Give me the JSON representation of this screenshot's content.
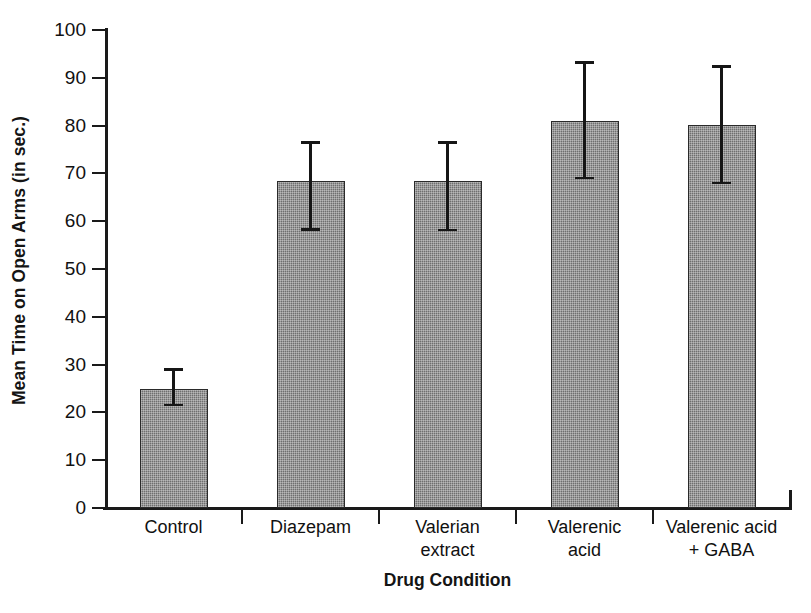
{
  "chart_data": {
    "type": "bar",
    "title": "",
    "subtitle": "",
    "xlabel": "Drug Condition",
    "ylabel": "Mean Time on Open Arms (in sec.)",
    "categories": [
      "Control",
      "Diazepam",
      "Valerian\nextract",
      "Valerenic\nacid",
      "Valerenic acid\n+ GABA"
    ],
    "values": [
      25,
      68.5,
      68.5,
      81,
      80.2
    ],
    "error_upper": [
      29,
      76.5,
      76.5,
      93.2,
      92.4
    ],
    "error_lower": [
      21.5,
      58.3,
      58.2,
      69,
      68
    ],
    "ylim": [
      0,
      100
    ],
    "yticks": [
      0,
      10,
      20,
      30,
      40,
      50,
      60,
      70,
      80,
      90,
      100
    ],
    "ytick_labels": [
      "0",
      "10",
      "20",
      "30",
      "40",
      "50",
      "60",
      "70",
      "80",
      "90",
      "100"
    ],
    "grid": false,
    "legend": null,
    "bar_color": "#6f6f6f",
    "bar_edge_color": "#2a2a2a",
    "axis_color": "#1a1a1a",
    "error_bar_color": "#161616",
    "background": "#ffffff"
  }
}
